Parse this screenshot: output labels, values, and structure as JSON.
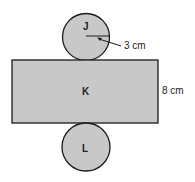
{
  "diagram": {
    "type": "cylinder-net",
    "shapes": {
      "top_circle": {
        "label": "J"
      },
      "rectangle": {
        "label": "K"
      },
      "bottom_circle": {
        "label": "L"
      }
    },
    "dimensions": {
      "radius": "3 cm",
      "height": "8 cm"
    },
    "colors": {
      "fill": "#c8c8c8",
      "stroke": "#1a1a1a",
      "background": "#ffffff"
    }
  }
}
